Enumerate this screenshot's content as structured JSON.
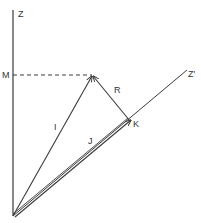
{
  "diagram": {
    "colors": {
      "stroke": "#3a3a3a",
      "background": "#ffffff"
    },
    "axes": {
      "z_label": "Z",
      "z_prime_label": "Z'"
    },
    "points": {
      "m_label": "M",
      "k_label": "K"
    },
    "vectors": {
      "i_label": "I",
      "j_label": "J",
      "r_label": "R"
    }
  }
}
